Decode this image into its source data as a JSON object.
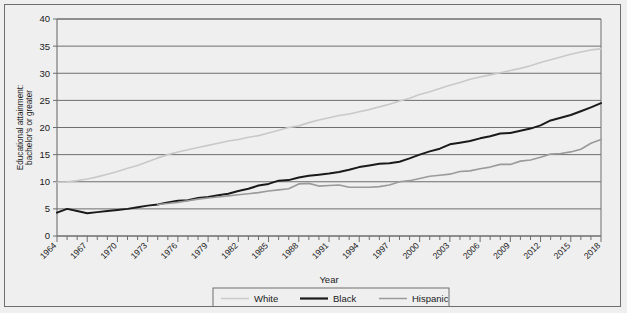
{
  "chart_data": {
    "type": "line",
    "title": "",
    "xlabel": "Year",
    "ylabel": "Educational attainment: bachelor's or greater",
    "ylim": [
      0,
      40
    ],
    "xlim": [
      1964,
      2018
    ],
    "yticks": [
      0,
      5,
      10,
      15,
      20,
      25,
      30,
      35,
      40
    ],
    "xticks": [
      1964,
      1967,
      1970,
      1973,
      1976,
      1979,
      1982,
      1985,
      1988,
      1991,
      1994,
      1997,
      2000,
      2003,
      2006,
      2009,
      2012,
      2015,
      2018
    ],
    "xtick_step": 3,
    "x_minor_step": 1,
    "grid": "horizontal",
    "legend_position": "bottom",
    "x": [
      1964,
      1965,
      1966,
      1967,
      1968,
      1969,
      1970,
      1971,
      1972,
      1973,
      1974,
      1975,
      1976,
      1977,
      1978,
      1979,
      1980,
      1981,
      1982,
      1983,
      1984,
      1985,
      1986,
      1987,
      1988,
      1989,
      1990,
      1991,
      1992,
      1993,
      1994,
      1995,
      1996,
      1997,
      1998,
      1999,
      2000,
      2001,
      2002,
      2003,
      2004,
      2005,
      2006,
      2007,
      2008,
      2009,
      2010,
      2011,
      2012,
      2013,
      2014,
      2015,
      2016,
      2017,
      2018
    ],
    "series": [
      {
        "name": "White",
        "color": "#c9c9c9",
        "width": 1.6,
        "values": [
          9.9,
          10.0,
          10.2,
          10.5,
          10.9,
          11.4,
          11.9,
          12.5,
          13.0,
          13.7,
          14.4,
          15.0,
          15.5,
          15.9,
          16.3,
          16.7,
          17.1,
          17.5,
          17.8,
          18.2,
          18.5,
          19.0,
          19.5,
          20.0,
          20.3,
          20.9,
          21.4,
          21.8,
          22.2,
          22.5,
          22.9,
          23.3,
          23.8,
          24.3,
          24.9,
          25.4,
          26.1,
          26.6,
          27.2,
          27.8,
          28.3,
          28.9,
          29.3,
          29.7,
          30.1,
          30.5,
          30.9,
          31.4,
          32.0,
          32.5,
          33.0,
          33.5,
          33.9,
          34.3,
          34.5
        ]
      },
      {
        "name": "Black",
        "color": "#1a1a1a",
        "width": 2.0,
        "values": [
          4.3,
          5.0,
          4.6,
          4.2,
          4.4,
          4.6,
          4.8,
          5.0,
          5.3,
          5.6,
          5.8,
          6.2,
          6.5,
          6.6,
          7.0,
          7.2,
          7.5,
          7.8,
          8.3,
          8.7,
          9.3,
          9.6,
          10.2,
          10.3,
          10.8,
          11.1,
          11.3,
          11.5,
          11.8,
          12.2,
          12.7,
          13.0,
          13.3,
          13.4,
          13.7,
          14.3,
          15.0,
          15.6,
          16.1,
          16.9,
          17.2,
          17.5,
          18.0,
          18.4,
          18.9,
          19.0,
          19.4,
          19.8,
          20.4,
          21.3,
          21.8,
          22.3,
          23.0,
          23.7,
          24.5
        ]
      },
      {
        "name": "Hispanic",
        "color": "#9a9a9a",
        "width": 1.6,
        "values": [
          null,
          null,
          null,
          null,
          null,
          null,
          null,
          null,
          null,
          null,
          5.8,
          6.0,
          6.2,
          6.5,
          6.8,
          7.0,
          7.2,
          7.4,
          7.6,
          7.8,
          8.0,
          8.3,
          8.5,
          8.7,
          9.6,
          9.7,
          9.2,
          9.3,
          9.4,
          9.0,
          9.0,
          9.0,
          9.1,
          9.4,
          10.0,
          10.2,
          10.6,
          11.0,
          11.2,
          11.4,
          11.9,
          12.0,
          12.4,
          12.7,
          13.2,
          13.2,
          13.8,
          14.0,
          14.5,
          15.1,
          15.2,
          15.5,
          16.0,
          17.1,
          17.8
        ]
      }
    ]
  },
  "axis": {
    "y_title": "Educational attainment:\nbachelor's or greater",
    "y_title_line1": "Educational attainment:",
    "y_title_line2": "bachelor's or greater",
    "x_title": "Year"
  },
  "legend": {
    "items": [
      {
        "label": "White",
        "color": "#c9c9c9"
      },
      {
        "label": "Black",
        "color": "#1a1a1a"
      },
      {
        "label": "Hispanic",
        "color": "#9a9a9a"
      }
    ]
  }
}
